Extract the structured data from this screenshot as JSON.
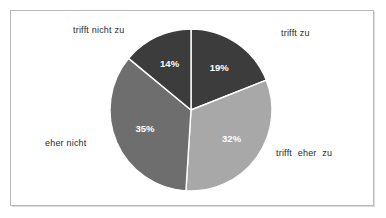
{
  "chart_data": {
    "type": "pie",
    "title": "",
    "subtitle": "",
    "xlabel": "",
    "ylabel": "",
    "legend_position": "none",
    "grid": false,
    "value_suffix": "%",
    "categories": [
      "trifft zu",
      "trifft eher zu",
      "eher nicht",
      "trifft nicht zu"
    ],
    "values": [
      19,
      32,
      35,
      14
    ],
    "start_angle_deg": 0,
    "direction": "clockwise",
    "slices": [
      {
        "label": "trifft zu",
        "value": 19,
        "value_text": "19%",
        "color": "#3c3c3c",
        "label_position": "top-right"
      },
      {
        "label": "trifft eher zu",
        "value": 32,
        "value_text": "32%",
        "color": "#a8a8a8",
        "label_position": "bottom-right"
      },
      {
        "label": "eher nicht",
        "value": 35,
        "value_text": "35%",
        "color": "#6e6e6e",
        "label_position": "left"
      },
      {
        "label": "trifft nicht zu",
        "value": 14,
        "value_text": "14%",
        "color": "#3c3c3c",
        "label_position": "top-left"
      }
    ]
  },
  "colors": {
    "slice_dark": "#3c3c3c",
    "slice_medium": "#6e6e6e",
    "slice_light": "#a8a8a8",
    "slice_separator": "#ffffff",
    "frame_border": "#b9b9b9",
    "background": "#ffffff",
    "value_text": "#ffffff",
    "category_text": "#2a2a2a"
  }
}
